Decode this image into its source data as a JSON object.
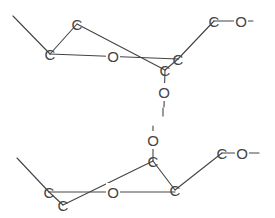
{
  "diagram": {
    "type": "chemical-structure",
    "colors": {
      "line": "#444444",
      "background": "#ffffff"
    },
    "upper_fragment": {
      "atoms": [
        {
          "id": "u_c1",
          "label": "C",
          "x": 50,
          "y": 54
        },
        {
          "id": "u_c2",
          "label": "C",
          "x": 77,
          "y": 24
        },
        {
          "id": "u_o_ring",
          "label": "O",
          "x": 113,
          "y": 56
        },
        {
          "id": "u_c3",
          "label": "C",
          "x": 178,
          "y": 59
        },
        {
          "id": "u_c4",
          "label": "C",
          "x": 165,
          "y": 70
        },
        {
          "id": "u_c5",
          "label": "C",
          "x": 214,
          "y": 21
        },
        {
          "id": "u_o_side",
          "label": "O",
          "x": 241,
          "y": 21
        },
        {
          "id": "u_o_bridge",
          "label": "O",
          "x": 164,
          "y": 92
        }
      ]
    },
    "lower_fragment": {
      "atoms": [
        {
          "id": "l_o_bridge",
          "label": "O",
          "x": 153,
          "y": 140
        },
        {
          "id": "l_c1",
          "label": "C",
          "x": 153,
          "y": 161
        },
        {
          "id": "l_c2",
          "label": "C",
          "x": 175,
          "y": 190
        },
        {
          "id": "l_c3",
          "label": "C",
          "x": 222,
          "y": 153
        },
        {
          "id": "l_o_side",
          "label": "O",
          "x": 242,
          "y": 153
        },
        {
          "id": "l_c4",
          "label": "C",
          "x": 49,
          "y": 192
        },
        {
          "id": "l_c5",
          "label": "C",
          "x": 63,
          "y": 205
        },
        {
          "id": "l_o_ring",
          "label": "O",
          "x": 113,
          "y": 192
        }
      ]
    }
  }
}
